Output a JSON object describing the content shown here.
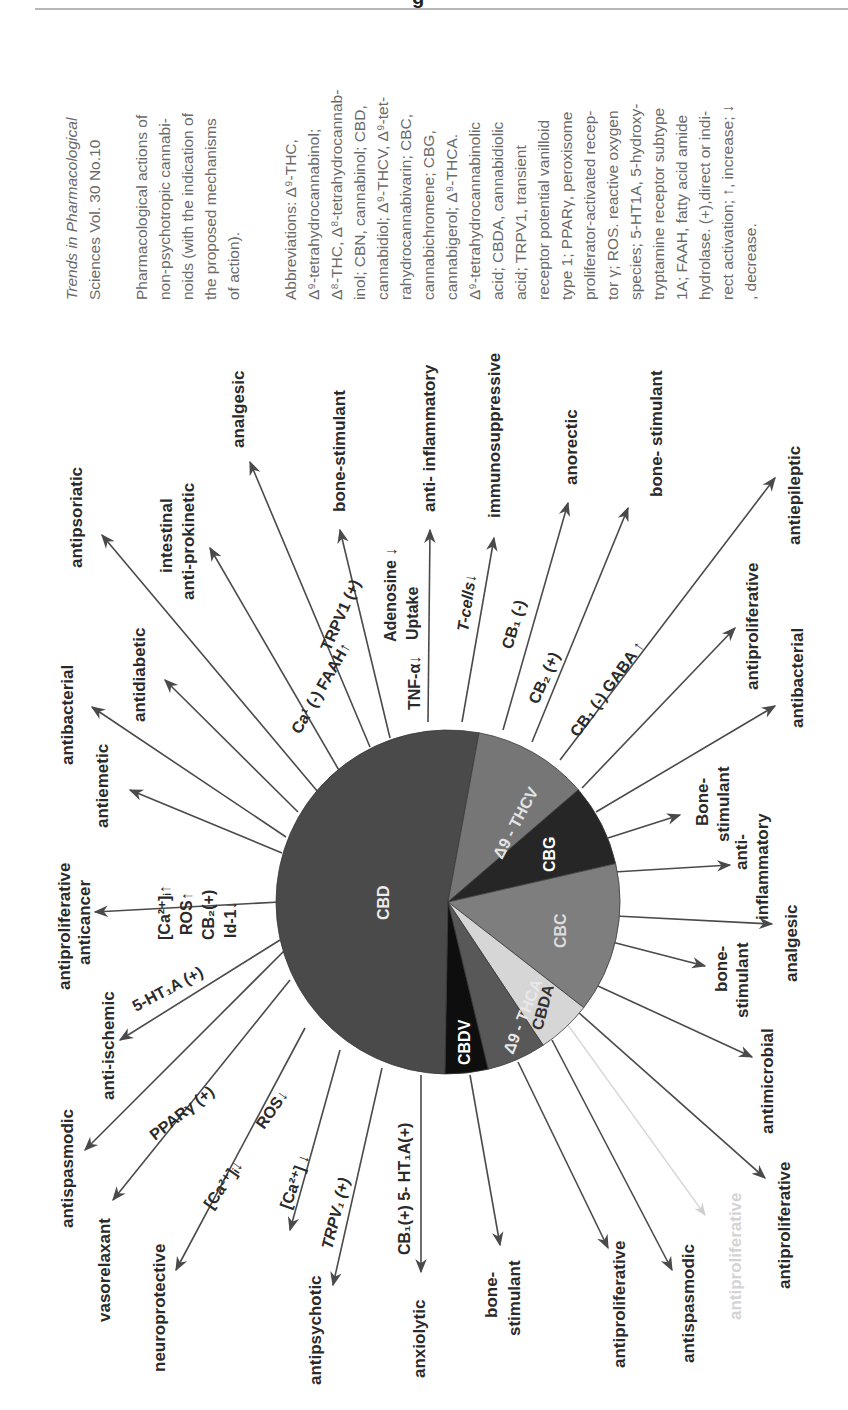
{
  "header": {
    "glyph": "g"
  },
  "caption": {
    "journal_italic": "Trends in Pharmacological",
    "journal_rest": "Sciences Vol. 30 No.10",
    "description_lines": [
      "Pharmacological actions of",
      "non-psychotropic cannabi-",
      "noids (with the indication of",
      "the proposed mechanisms",
      "of action)."
    ],
    "abbreviation_lines": [
      "Abbreviations: Δ⁹-THC,",
      "Δ⁹-tetrahydrocannabinol;",
      "Δ⁸-THC, Δ⁸-tetrahydrocannab-",
      "inol; CBN, cannabinol; CBD,",
      "cannabidiol; Δ⁹-THCV, Δ⁹-tet-",
      "rahydrocannabivarin; CBC,",
      "cannabichromene; CBG,",
      "cannabigerol; Δ⁹-THCA.",
      "Δ⁹-tetrahydrocannabinolic",
      "acid; CBDA, cannabidiolic",
      "acid; TRPV1, transient",
      "receptor potential vanilloid",
      "type 1; PPARγ, peroxisome",
      "proliferator-activated recep-",
      "tor γ; ROS. reactive oxygen",
      "species; 5-HT1A, 5-hydroxy-",
      "tryptamine receptor subtype",
      "1A; FAAH, fatty acid amide",
      "hydrolase. (+),direct or indi-",
      "rect activation; ↑, increase; ↓",
      ", decrease."
    ]
  },
  "chart_data": {
    "type": "pie",
    "slices": [
      {
        "name": "CBD",
        "start_deg": 91,
        "end_deg": 280.4,
        "color": "#4a4a4a"
      },
      {
        "name": "Δ9-THCV",
        "start_deg": -79.6,
        "end_deg": -40.7,
        "color": "#767676"
      },
      {
        "name": "CBG",
        "start_deg": -40.7,
        "end_deg": -12.9,
        "color": "#262626"
      },
      {
        "name": "CBC",
        "start_deg": -12.9,
        "end_deg": 37.9,
        "color": "#7e7e7e"
      },
      {
        "name": "CBDA",
        "start_deg": 37.9,
        "end_deg": 56.4,
        "color": "#d6d6d6"
      },
      {
        "name": "Δ9-THCA",
        "start_deg": 56.4,
        "end_deg": 76.5,
        "color": "#585858"
      },
      {
        "name": "CBDV",
        "start_deg": 76.5,
        "end_deg": 91,
        "color": "#0e0e0e"
      }
    ],
    "effects": {
      "CBD": [
        {
          "effect": "antiproliferative anticancer",
          "mechanism": "[Ca2+]i↑ ROS↑ CB2(+) Id-1↓"
        },
        {
          "effect": "antiemetic",
          "mechanism": ""
        },
        {
          "effect": "antibacterial",
          "mechanism": ""
        },
        {
          "effect": "antidiabetic",
          "mechanism": ""
        },
        {
          "effect": "antipsoriatic",
          "mechanism": ""
        },
        {
          "effect": "intestinal anti-prokinetic",
          "mechanism": "Ca¹(-) FAAH↑"
        },
        {
          "effect": "analgesic",
          "mechanism": "TRPV1 (+)"
        },
        {
          "effect": "bone-stimulant",
          "mechanism": ""
        },
        {
          "effect": "anti- inflammatory",
          "mechanism": "TNF-α↓ Adenosine Uptake↓"
        },
        {
          "effect": "immunosuppressive",
          "mechanism": "T-cells↓"
        },
        {
          "effect": "anti-ischemic",
          "mechanism": "5-HT1A (+)"
        },
        {
          "effect": "antispasmodic",
          "mechanism": ""
        },
        {
          "effect": "vasorelaxant",
          "mechanism": "PPARγ (+)"
        },
        {
          "effect": "neuroprotective",
          "mechanism": "[Ca2+]i↓ ROS↓"
        },
        {
          "effect": "antiepileptic",
          "mechanism": "[Ca2+] ↓"
        },
        {
          "effect": "antipsychotic",
          "mechanism": "TRPV1 (+)"
        },
        {
          "effect": "anxiolytic",
          "mechanism": "CB1(+) 5- HT1A(+)"
        }
      ],
      "Δ9-THCV": [
        {
          "effect": "anorectic",
          "mechanism": "CB1 (-)"
        },
        {
          "effect": "bone- stimulant",
          "mechanism": "CB2 (+)"
        },
        {
          "effect": "antiepileptic",
          "mechanism": "CB1 (-) GABA↑"
        }
      ],
      "CBG": [
        {
          "effect": "antiproliferative",
          "mechanism": ""
        },
        {
          "effect": "antibacterial",
          "mechanism": ""
        },
        {
          "effect": "Bone- stimulant",
          "mechanism": ""
        }
      ],
      "CBC": [
        {
          "effect": "anti- inflammatory",
          "mechanism": ""
        },
        {
          "effect": "analgesic",
          "mechanism": ""
        },
        {
          "effect": "bone- stimulant",
          "mechanism": ""
        },
        {
          "effect": "antimicrobial",
          "mechanism": ""
        }
      ],
      "CBDA": [
        {
          "effect": "antiproliferative",
          "mechanism": ""
        },
        {
          "effect": "antiproliferative (faded)",
          "mechanism": ""
        }
      ],
      "Δ9-THCA": [
        {
          "effect": "antispasmodic",
          "mechanism": ""
        },
        {
          "effect": "antiproliferative",
          "mechanism": ""
        }
      ],
      "CBDV": [
        {
          "effect": "bone- stimulant",
          "mechanism": ""
        }
      ]
    }
  },
  "pie": {
    "cbd": "CBD",
    "thcv": "Δ9 - THCV",
    "cbg": "CBG",
    "cbc": "CBC",
    "cbda": "CBDA",
    "thca": "Δ9 - THCA",
    "cbdv": "CBDV"
  },
  "labels": {
    "antiproliferative_anticancer_1": "antiproliferative",
    "antiproliferative_anticancer_2": "anticancer",
    "antiemetic": "antiemetic",
    "antibacterial_left": "antibacterial",
    "antidiabetic": "antidiabetic",
    "antipsoriatic": "antipsoriatic",
    "intestinal": "intestinal",
    "anti_prokinetic": "anti-prokinetic",
    "analgesic_top": "analgesic",
    "bone_stimulant_top": "bone-stimulant",
    "anti_inflammatory_top": "anti- inflammatory",
    "immunosuppressive": "immunosuppressive",
    "anorectic": "anorectic",
    "bone_stimulant_thcv": "bone- stimulant",
    "antiepileptic_thcv": "antiepileptic",
    "antiproliferative_cbg": "antiproliferative",
    "antibacterial_cbg": "antibacterial",
    "bone_cbg_1": "Bone-",
    "bone_cbg_2": "stimulant",
    "anti_infl_cbc_1": "anti-",
    "anti_infl_cbc_2": "inflammatory",
    "analgesic_cbc": "analgesic",
    "bone_cbc_1": "bone-",
    "bone_cbc_2": "stimulant",
    "antimicrobial": "antimicrobial",
    "antiproliferative_cbda": "antiproliferative",
    "antiproliferative_faded": "antiproliferative",
    "antispasmodic_thca": "antispasmodic",
    "antiproliferative_thca": "antiproliferative",
    "bone_cbdv_1": "bone-",
    "bone_cbdv_2": "stimulant",
    "anxiolytic": "anxiolytic",
    "antipsychotic": "antipsychotic",
    "antiepileptic_cbd": "antiepileptic",
    "neuroprotective": "neuroprotective",
    "vasorelaxant": "vasorelaxant",
    "antispasmodic_cbd": "antispasmodic",
    "anti_ischemic": "anti-ischemic"
  },
  "mechanisms": {
    "ca_i_up": "[Ca²⁺]ᵢ↑",
    "ros_up": "ROS↑",
    "cb2_plus": "CB₂(+)",
    "id1_down": "Id-1↓",
    "ca_faah": "Ca¹ (-) FAAH↑",
    "trpv1_top": "TRPV1 (+)",
    "tnf": "TNF-α↓",
    "adenosine": "Adenosine ↓",
    "uptake": "Uptake",
    "tcells": "T-cells↓",
    "cb1_minus": "CB₁ (-)",
    "cb2_plus_thcv": "CB₂ (+)",
    "cb1_minus_gaba": "CB₁ (-)  GABA ↑",
    "ht1a": "5-HT₁A (+)",
    "ppar": "PPARγ (+)",
    "ca_i_down": "[Ca²⁺]ᵢ↓",
    "ros_down": "ROS↓",
    "ca_down": "[Ca²⁺] ↓",
    "trpv1_bottom": "TRPV₁ (+)",
    "cb1_5ht": "CB₁(+) 5- HT₁A(+)"
  }
}
